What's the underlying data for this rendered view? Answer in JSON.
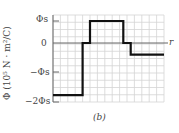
{
  "chart_data": {
    "type": "line",
    "step": true,
    "title": "",
    "xlabel": "r",
    "ylabel": "Φ (10^5 N·m^2/C)",
    "ylabel_display": "Φ (10⁵ N · m²/C)",
    "yticks": [
      "Φs",
      "0",
      "−Φs",
      "−2Φs"
    ],
    "ytick_values": [
      1,
      0,
      -1,
      -2
    ],
    "ylim": [
      -2,
      1.2
    ],
    "xlim": [
      0,
      15
    ],
    "grid": true,
    "grid_columns": 15,
    "grid_rows": 12,
    "series": [
      {
        "name": "Φ(r)",
        "x": [
          0,
          4,
          4,
          5,
          5,
          9.5,
          9.5,
          10.5,
          10.5,
          15
        ],
        "y": [
          -1.8,
          -1.8,
          0,
          0,
          1,
          1,
          0,
          0,
          -0.4,
          -0.4
        ]
      }
    ],
    "caption": "(b)"
  },
  "labels": {
    "ytick_top": "Φs",
    "ytick_zero": "0",
    "ytick_neg1": "−Φs",
    "ytick_neg2": "−2Φs",
    "x_axis": "r",
    "caption": "(b)"
  }
}
